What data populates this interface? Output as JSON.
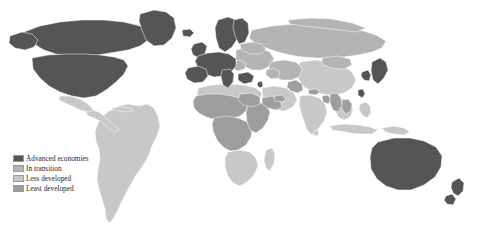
{
  "figure": {
    "name": "world-development-classification-map",
    "projection": "equirectangular",
    "background_color": "#ffffff",
    "border_color": "#9a9a9a"
  },
  "legend": {
    "position": "bottom-left",
    "items": [
      {
        "label": "Advanced economies",
        "color": "#555555",
        "key": "advanced"
      },
      {
        "label": "In transition",
        "color": "#b4b4b4",
        "key": "transition"
      },
      {
        "label": "Less developed",
        "color": "#c8c8c8",
        "key": "less"
      },
      {
        "label": "Least developed",
        "color": "#9e9e9e",
        "key": "least"
      }
    ]
  },
  "categories": {
    "advanced": {
      "label": "Advanced economies",
      "color": "#555555",
      "regions": [
        "United States",
        "Canada",
        "Greenland",
        "Western Europe",
        "Nordic countries",
        "Japan",
        "South Korea",
        "Taiwan",
        "Australia",
        "New Zealand",
        "Israel"
      ]
    },
    "transition": {
      "label": "In transition",
      "color": "#b4b4b4",
      "regions": [
        "Russia",
        "Eastern Europe",
        "Central Asia",
        "Caucasus",
        "Mongolia"
      ]
    },
    "less": {
      "label": "Less developed",
      "color": "#c8c8c8",
      "regions": [
        "South America",
        "Mexico",
        "Central America",
        "Caribbean",
        "North Africa",
        "Southern Africa",
        "Middle East",
        "India",
        "China",
        "Southeast Asia",
        "Indonesia"
      ]
    },
    "least": {
      "label": "Least developed",
      "color": "#9e9e9e",
      "regions": [
        "Sahel",
        "Central Africa",
        "East Africa",
        "Afghanistan",
        "Nepal",
        "Bangladesh",
        "Myanmar",
        "Laos",
        "Cambodia",
        "Yemen"
      ]
    }
  }
}
